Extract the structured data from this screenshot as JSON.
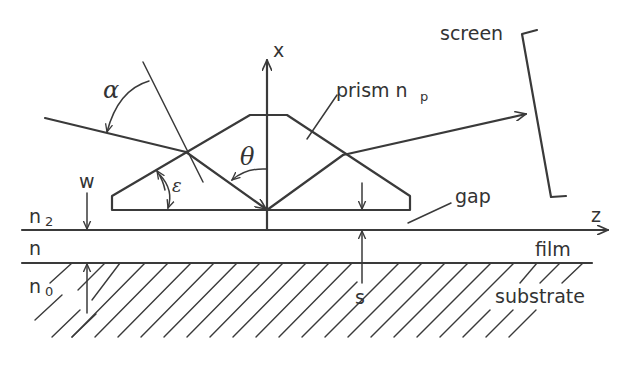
{
  "figure": {
    "type": "optical prism-coupler schematic",
    "labels": {
      "x_axis": "x",
      "z_axis": "z",
      "screen": "screen",
      "prism": "prism n",
      "prism_subscript": "p",
      "gap": "gap",
      "film": "film",
      "substrate": "substrate",
      "w": "w",
      "s": "s",
      "n2": "n",
      "n2_subscript": "2",
      "n": "n",
      "n0": "n",
      "n0_subscript": "0"
    },
    "angles": {
      "alpha": "α",
      "theta": "θ",
      "epsilon": "ε"
    },
    "layers": [
      "gap (n2)",
      "film (n)",
      "substrate (n0)"
    ],
    "line_color": "#3a3a3a",
    "background_color": "#ffffff"
  }
}
